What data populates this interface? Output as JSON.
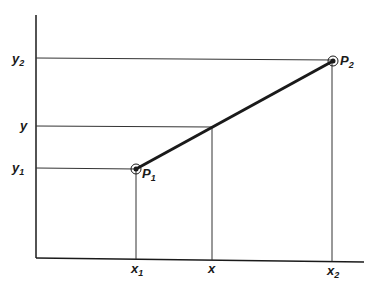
{
  "diagram": {
    "type": "linear-interpolation",
    "labels": {
      "y2": {
        "base": "y",
        "sub": "2"
      },
      "y": {
        "base": "y",
        "sub": ""
      },
      "y1": {
        "base": "y",
        "sub": "1"
      },
      "x1": {
        "base": "x",
        "sub": "1"
      },
      "x": {
        "base": "x",
        "sub": ""
      },
      "x2": {
        "base": "x",
        "sub": "2"
      },
      "p1": {
        "base": "P",
        "sub": "1"
      },
      "p2": {
        "base": "P",
        "sub": "2"
      }
    },
    "colors": {
      "line": "#1a1a1a",
      "guide": "#333333",
      "background": "#ffffff"
    }
  }
}
